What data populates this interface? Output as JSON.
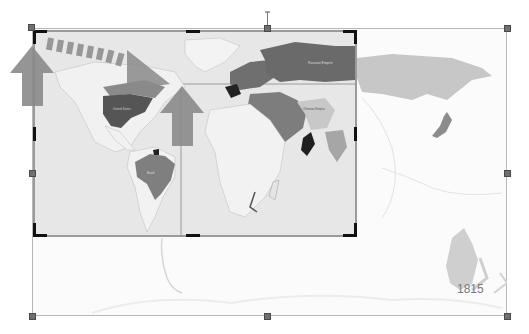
{
  "image": {
    "title_label": "1815",
    "mode": "crop"
  },
  "map_labels": {
    "russian_empire": "Russian Empire",
    "united_states": "United States",
    "brazil": "Brazil",
    "ottoman_empire": "Ottoman Empire",
    "australia": "Australia"
  },
  "colors": {
    "crop_handle": "#111111",
    "resize_handle": "#6f6f6f",
    "arrow": "#8a8a8a",
    "dark_region": "#555555",
    "mid_region": "#808080",
    "land": "#f2f2f2",
    "ocean": "#e4e4e4"
  },
  "icons": {
    "rotate_handle": "rotate-handle-icon",
    "up_arrow_left": "up-arrow-icon",
    "up_arrow_center": "up-arrow-icon",
    "dashed_arrow": "dashed-arrow-icon"
  }
}
